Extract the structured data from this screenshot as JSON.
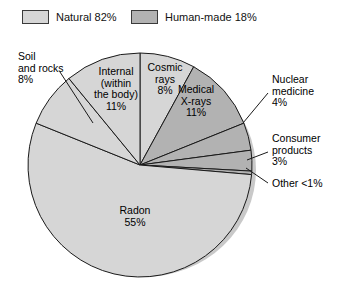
{
  "legend": {
    "entries": [
      {
        "label": "Natural 82%",
        "color": "#d6d6d6",
        "swatch_name": "natural-swatch"
      },
      {
        "label": "Human-made 18%",
        "color": "#b2b2b2",
        "swatch_name": "human-made-swatch"
      }
    ]
  },
  "labels": {
    "soil": "Soil\nand rocks\n8%",
    "soil_l1": "Soil",
    "soil_l2": "and rocks",
    "soil_l3": "8%",
    "internal_l1": "Internal",
    "internal_l2": "(within",
    "internal_l3": "the body)",
    "internal_l4": "11%",
    "cosmic_l1": "Cosmic",
    "cosmic_l2": "rays",
    "cosmic_l3": "8%",
    "medical_l1": "Medical",
    "medical_l2": "X-rays",
    "medical_l3": "11%",
    "nuclear_l1": "Nuclear",
    "nuclear_l2": "medicine",
    "nuclear_l3": "4%",
    "consumer_l1": "Consumer",
    "consumer_l2": "products",
    "consumer_l3": "3%",
    "other_l1": "Other <1%",
    "radon_l1": "Radon",
    "radon_l2": "55%"
  },
  "chart_data": {
    "type": "pie",
    "title": "",
    "categories": [
      "Cosmic rays",
      "Medical X-rays",
      "Nuclear medicine",
      "Consumer products",
      "Other",
      "Radon",
      "Soil and rocks",
      "Internal (within the body)"
    ],
    "values": [
      8,
      11,
      4,
      3,
      0.5,
      55,
      8,
      11
    ],
    "value_labels": [
      "8%",
      "11%",
      "4%",
      "3%",
      "<1%",
      "55%",
      "8%",
      "11%"
    ],
    "groups": [
      "Natural",
      "Human-made",
      "Human-made",
      "Human-made",
      "Human-made",
      "Natural",
      "Natural",
      "Natural"
    ],
    "group_totals": {
      "Natural": 82,
      "Human-made": 18
    },
    "colors": [
      "#d6d6d6",
      "#b2b2b2",
      "#b2b2b2",
      "#b2b2b2",
      "#b2b2b2",
      "#d6d6d6",
      "#d6d6d6",
      "#d6d6d6"
    ],
    "start_angle_deg": 0,
    "direction": "clockwise",
    "legend": [
      "Natural 82%",
      "Human-made 18%"
    ],
    "legend_position": "top"
  }
}
